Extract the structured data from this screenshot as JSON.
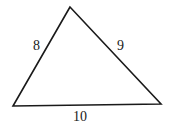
{
  "diagram": {
    "type": "triangle",
    "vertices": {
      "top": [
        70,
        7
      ],
      "bottom_left": [
        13,
        106
      ],
      "bottom_right": [
        161,
        104
      ]
    },
    "sides": [
      {
        "name": "left",
        "label": "8"
      },
      {
        "name": "right",
        "label": "9"
      },
      {
        "name": "base",
        "label": "10"
      }
    ],
    "stroke_color": "#1a1a1a",
    "background": "#ffffff"
  }
}
